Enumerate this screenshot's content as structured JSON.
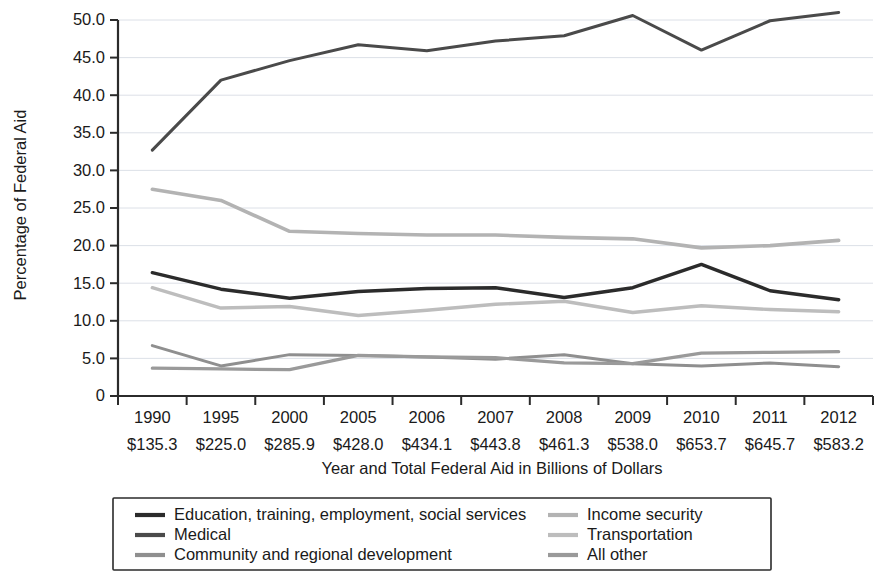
{
  "chart_data": {
    "type": "line",
    "title": "",
    "xlabel": "Year and Total Federal Aid in Billions of Dollars",
    "ylabel": "Percentage of Federal Aid",
    "categories": [
      "1990",
      "1995",
      "2000",
      "2005",
      "2006",
      "2007",
      "2008",
      "2009",
      "2010",
      "2011",
      "2012"
    ],
    "category_sublabels": [
      "$135.3",
      "$225.0",
      "$285.9",
      "$428.0",
      "$434.1",
      "$443.8",
      "$461.3",
      "$538.0",
      "$653.7",
      "$645.7",
      "$583.2"
    ],
    "ylim": [
      0,
      50
    ],
    "ytick_labels": [
      "0",
      "5.0",
      "10.0",
      "15.0",
      "20.0",
      "25.0",
      "30.0",
      "35.0",
      "40.0",
      "45.0",
      "50.0"
    ],
    "ytick_values": [
      0,
      5,
      10,
      15,
      20,
      25,
      30,
      35,
      40,
      45,
      50
    ],
    "grid": true,
    "legend_position": "below",
    "series": [
      {
        "name": "Education, training, employment, social services",
        "color": "#2b2b2b",
        "width": 3.4,
        "values": [
          16.4,
          14.2,
          13.0,
          13.9,
          14.3,
          14.4,
          13.1,
          14.4,
          17.5,
          14.0,
          12.8
        ]
      },
      {
        "name": "Medical",
        "color": "#4a4a4a",
        "width": 3.0,
        "values": [
          32.7,
          42.0,
          44.6,
          46.7,
          45.9,
          47.2,
          47.9,
          50.6,
          46.0,
          49.9,
          51.0
        ]
      },
      {
        "name": "Community and regional development",
        "color": "#8f8f8f",
        "width": 3.0,
        "values": [
          6.7,
          4.0,
          5.5,
          5.4,
          5.2,
          4.9,
          5.5,
          4.3,
          4.0,
          4.4,
          3.9
        ]
      },
      {
        "name": "Income security",
        "color": "#b3b3b3",
        "width": 3.6,
        "values": [
          27.5,
          26.0,
          21.9,
          21.6,
          21.4,
          21.4,
          21.1,
          20.9,
          19.7,
          20.0,
          20.7
        ]
      },
      {
        "name": "Transportation",
        "color": "#bdbdbd",
        "width": 3.4,
        "values": [
          14.4,
          11.7,
          11.9,
          10.7,
          11.4,
          12.2,
          12.6,
          11.1,
          12.0,
          11.5,
          11.2
        ]
      },
      {
        "name": "All other",
        "color": "#9a9a9a",
        "width": 3.2,
        "values": [
          3.7,
          3.6,
          3.5,
          5.4,
          5.2,
          5.1,
          4.4,
          4.3,
          5.7,
          5.8,
          5.9
        ]
      }
    ],
    "legend_entries": [
      {
        "label": "Education, training, employment, social services",
        "color": "#2b2b2b",
        "column": 0,
        "row": 0
      },
      {
        "label": "Medical",
        "color": "#4a4a4a",
        "column": 0,
        "row": 1
      },
      {
        "label": "Community and regional development",
        "color": "#8f8f8f",
        "column": 0,
        "row": 2
      },
      {
        "label": "Income security",
        "color": "#b3b3b3",
        "column": 1,
        "row": 0
      },
      {
        "label": "Transportation",
        "color": "#bdbdbd",
        "column": 1,
        "row": 1
      },
      {
        "label": "All other",
        "color": "#9a9a9a",
        "column": 1,
        "row": 2
      }
    ]
  },
  "colors": {
    "background": "#ffffff",
    "axis": "#2b2b2b",
    "grid": "#d8dce4",
    "text": "#1a1a1a"
  }
}
